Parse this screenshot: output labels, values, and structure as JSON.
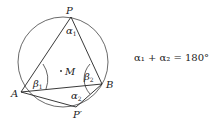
{
  "diagram": {
    "points": {
      "P": "P",
      "A": "A",
      "B": "B",
      "P_prime": "P′",
      "M": "M"
    },
    "angles": {
      "alpha1": "α",
      "alpha1_sub": "1",
      "alpha2": "α",
      "alpha2_sub": "2",
      "beta1": "β",
      "beta1_sub": "1",
      "beta2": "β",
      "beta2_sub": "2"
    },
    "equation": "α₁ + α₂ = 180°"
  }
}
